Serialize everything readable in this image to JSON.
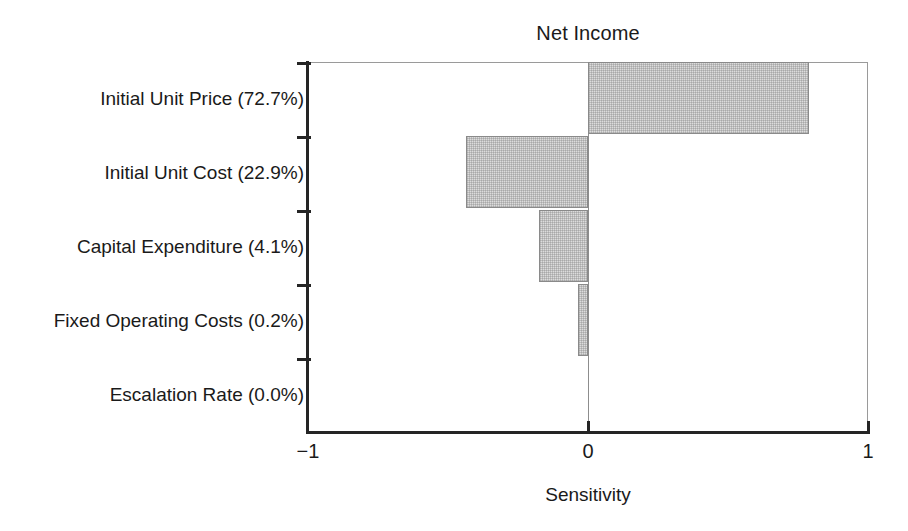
{
  "chart_data": {
    "type": "bar",
    "orientation": "horizontal",
    "subtype": "tornado",
    "title": "Net Income",
    "xlabel": "Sensitivity",
    "ylabel": "",
    "xlim": [
      -1,
      1
    ],
    "xticks": [
      -1,
      0,
      1
    ],
    "xtick_labels": [
      "−1",
      "0",
      "1"
    ],
    "grid": false,
    "legend": "none",
    "zero_reference_line": 0,
    "categories": [
      "Initial Unit Price (72.7%)",
      "Initial Unit Cost (22.9%)",
      "Capital Expenditure (4.1%)",
      "Fixed Operating Costs (0.2%)",
      "Escalation Rate (0.0%)"
    ],
    "values": [
      0.79,
      -0.435,
      -0.175,
      -0.036,
      0.0
    ],
    "contributions_percent": [
      72.7,
      22.9,
      4.1,
      0.2,
      0.0
    ],
    "bars": [
      {
        "category": "Initial Unit Price (72.7%)",
        "value": 0.79,
        "percent": "72.7%"
      },
      {
        "category": "Initial Unit Cost (22.9%)",
        "value": -0.435,
        "percent": "22.9%"
      },
      {
        "category": "Capital Expenditure (4.1%)",
        "value": -0.175,
        "percent": "4.1%"
      },
      {
        "category": "Fixed Operating Costs (0.2%)",
        "value": -0.036,
        "percent": "0.2%"
      },
      {
        "category": "Escalation Rate (0.0%)",
        "value": 0.0,
        "percent": "0.0%"
      }
    ]
  },
  "colors": {
    "background": "#ffffff",
    "axis": "#252525",
    "plot_border": "#9a9a9a",
    "bar_fill": "#dcdcdc",
    "bar_edge": "#8a8a8a",
    "text": "#1a1a1a",
    "zero_line": "#8d8d8d"
  }
}
